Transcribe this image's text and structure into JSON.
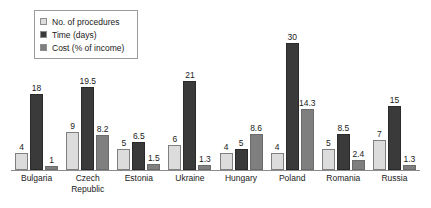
{
  "chart_data": {
    "type": "bar",
    "title": "",
    "subtitle": "",
    "xlabel": "",
    "ylabel": "",
    "ylim": [
      0,
      33
    ],
    "grid": false,
    "legend_position": "top-left",
    "categories": [
      "Bulgaria",
      "Czech Republic",
      "Estonia",
      "Ukraine",
      "Hungary",
      "Poland",
      "Romania",
      "Russia"
    ],
    "category_lines": [
      [
        "Bulgaria"
      ],
      [
        "Czech",
        "Republic"
      ],
      [
        "Estonia"
      ],
      [
        "Ukraine"
      ],
      [
        "Hungary"
      ],
      [
        "Poland"
      ],
      [
        "Romania"
      ],
      [
        "Russia"
      ]
    ],
    "series": [
      {
        "name": "No. of procedures",
        "color": "#dcdcdc",
        "values": [
          4,
          9,
          5,
          6,
          4,
          4,
          5,
          7
        ],
        "labels": [
          "4",
          "9",
          "5",
          "6",
          "4",
          "4",
          "5",
          "7"
        ]
      },
      {
        "name": "Time (days)",
        "color": "#3a3a3a",
        "values": [
          18,
          19.5,
          6.5,
          21,
          5,
          30,
          8.5,
          15
        ],
        "labels": [
          "18",
          "19.5",
          "6.5",
          "21",
          "5",
          "30",
          "8.5",
          "15"
        ]
      },
      {
        "name": "Cost (% of income)",
        "color": "#7f7f7f",
        "values": [
          1,
          8.2,
          1.5,
          1.3,
          8.6,
          14.3,
          2.4,
          1.3
        ],
        "labels": [
          "1",
          "8.2",
          "1.5",
          "1.3",
          "8.6",
          "14.3",
          "2.4",
          "1.3"
        ]
      }
    ]
  },
  "legend": {
    "items": [
      {
        "label": "No. of procedures",
        "color": "#dcdcdc"
      },
      {
        "label": "Time (days)",
        "color": "#3a3a3a"
      },
      {
        "label": "Cost (% of income)",
        "color": "#7f7f7f"
      }
    ]
  }
}
